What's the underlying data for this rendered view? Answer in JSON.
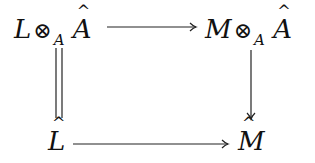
{
  "diagram": {
    "type": "commutative-square",
    "nodes": {
      "top_left": {
        "base": "L",
        "op": "⊗",
        "sub": "A",
        "hat_term": "A"
      },
      "top_right": {
        "base": "M",
        "op": "⊗",
        "sub": "A",
        "hat_term": "A"
      },
      "bottom_left": {
        "hat_term": "L"
      },
      "bottom_right": {
        "hat_term": "M"
      }
    },
    "arrows": [
      {
        "from": "top_left",
        "to": "top_right",
        "style": "single"
      },
      {
        "from": "top_left",
        "to": "bottom_left",
        "style": "equality"
      },
      {
        "from": "top_right",
        "to": "bottom_right",
        "style": "single"
      },
      {
        "from": "bottom_left",
        "to": "bottom_right",
        "style": "single"
      }
    ]
  }
}
